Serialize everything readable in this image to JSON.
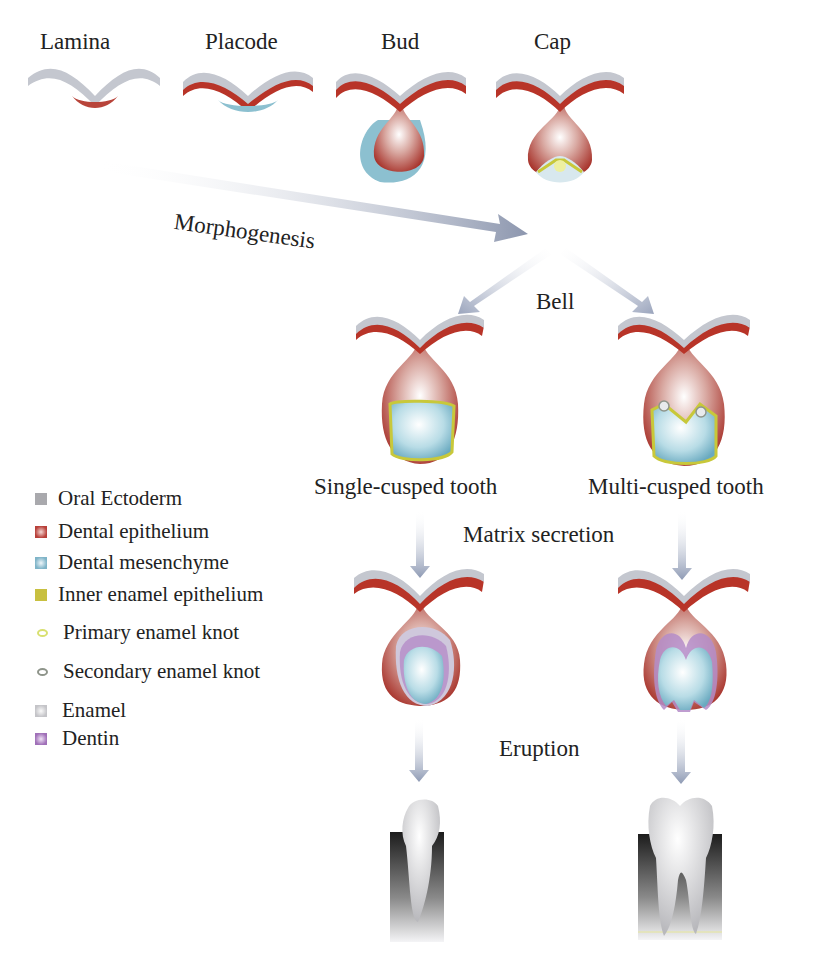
{
  "stages_top": [
    {
      "label": "Lamina",
      "x": 40,
      "y": 17
    },
    {
      "label": "Placode",
      "x": 205,
      "y": 17
    },
    {
      "label": "Bud",
      "x": 381,
      "y": 17
    },
    {
      "label": "Cap",
      "x": 532,
      "y": 17
    }
  ],
  "process_labels": {
    "morphogenesis": "Morphogenesis",
    "bell": "Bell",
    "matrix_secretion": "Matrix secretion",
    "eruption": "Eruption"
  },
  "branch_labels": {
    "single": "Single-cusped tooth",
    "multi": "Multi-cusped tooth"
  },
  "legend": {
    "items": [
      {
        "label": "Oral Ectoderm",
        "shape": "square",
        "color": "#a9a9ad"
      },
      {
        "label": "Dental epithelium",
        "shape": "square",
        "color": "#b8403a"
      },
      {
        "label": "Dental mesenchyme",
        "shape": "square",
        "color": "#7fb4c8"
      },
      {
        "label": "Inner enamel epithelium",
        "shape": "square",
        "color": "#c8c040"
      },
      {
        "label": "Primary enamel knot",
        "shape": "oval",
        "color": "#d8e070"
      },
      {
        "label": "Secondary enamel knot",
        "shape": "oval",
        "color": "#8e948a"
      },
      {
        "label": "Enamel",
        "shape": "square",
        "color": "#cfcfd2"
      },
      {
        "label": "Dentin",
        "shape": "square",
        "color": "#a070b8"
      }
    ]
  },
  "colors": {
    "ectoderm": "#b9bcc4",
    "epithelium": "#b8382e",
    "epithelium_light": "#d8a49c",
    "mesenchyme": "#8cc0d0",
    "inner_enamel": "#c8c83a",
    "dentin": "#b48cc8",
    "arrow": "#9aa3b8",
    "bone_dark": "#2a2a2a"
  }
}
